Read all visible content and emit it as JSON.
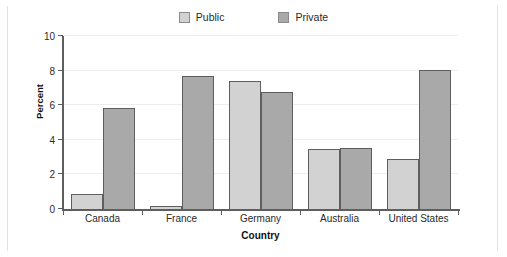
{
  "chart_data": {
    "type": "bar",
    "title": "",
    "xlabel": "Country",
    "ylabel": "Percent",
    "categories": [
      "Canada",
      "France",
      "Germany",
      "Australia",
      "United States"
    ],
    "series": [
      {
        "name": "Public",
        "color": "#d2d2d2",
        "values": [
          0.85,
          0.15,
          7.4,
          3.45,
          2.9
        ]
      },
      {
        "name": "Private",
        "color": "#a9a9a9",
        "values": [
          5.85,
          7.7,
          6.75,
          3.55,
          8.05
        ]
      }
    ],
    "ylim": [
      0,
      10
    ],
    "yticks": [
      0,
      2,
      4,
      6,
      8,
      10
    ],
    "ytick_labels": [
      "0",
      "2",
      "4",
      "6",
      "8",
      "10"
    ],
    "grid": true,
    "legend_position": "top-center"
  },
  "legend": {
    "items": [
      {
        "label": "Public",
        "color": "#d2d2d2"
      },
      {
        "label": "Private",
        "color": "#a9a9a9"
      }
    ]
  },
  "axes": {
    "y_title": "Percent",
    "x_title": "Country"
  }
}
